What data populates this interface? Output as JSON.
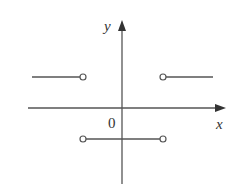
{
  "diagram": {
    "type": "piecewise-step-function-graph",
    "axes": {
      "x_label": "x",
      "y_label": "y",
      "origin_label": "0",
      "color": "#555555"
    },
    "segments": [
      {
        "name": "upper-left",
        "x1": 32,
        "x2": 83,
        "y": 77,
        "open_end": "right"
      },
      {
        "name": "upper-right",
        "x1": 163,
        "x2": 213,
        "y": 77,
        "open_end": "left"
      },
      {
        "name": "lower-middle",
        "x1": 83,
        "x2": 163,
        "y": 139,
        "open_end": "both"
      }
    ],
    "stroke_color": "#555555"
  }
}
